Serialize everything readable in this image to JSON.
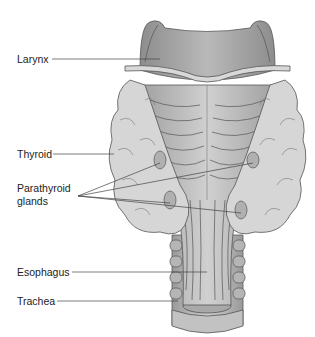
{
  "figure": {
    "colors": {
      "cartilage_dark": "#8a8a8a",
      "cartilage_mid": "#a8a8a8",
      "thyroid": "#d4d4d4",
      "muscle": "#b8b8b8",
      "outline": "#555555",
      "label_text": "#222222",
      "leader_line": "#444444"
    }
  },
  "labels": [
    {
      "id": "larynx",
      "text": "Larynx"
    },
    {
      "id": "thyroid",
      "text": "Thyroid"
    },
    {
      "id": "parathyroid_1",
      "text": "Parathyroid"
    },
    {
      "id": "parathyroid_2",
      "text": "glands"
    },
    {
      "id": "esophagus",
      "text": "Esophagus"
    },
    {
      "id": "trachea",
      "text": "Trachea"
    }
  ]
}
